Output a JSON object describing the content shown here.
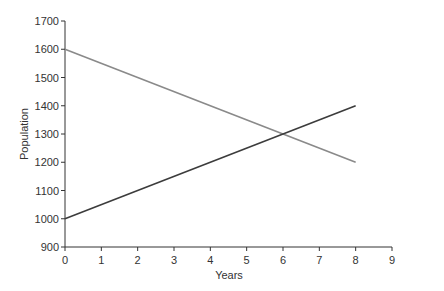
{
  "chart_data": {
    "type": "line",
    "title": "",
    "xlabel": "Years",
    "ylabel": "Population",
    "xlim": [
      0,
      9
    ],
    "ylim": [
      900,
      1700
    ],
    "xticks": [
      0,
      1,
      2,
      3,
      4,
      5,
      6,
      7,
      8,
      9
    ],
    "yticks": [
      900,
      1000,
      1100,
      1200,
      1300,
      1400,
      1500,
      1600,
      1700
    ],
    "grid": false,
    "legend": null,
    "series": [
      {
        "name": "Decreasing population",
        "color": "#8a8a8a",
        "x": [
          0,
          8
        ],
        "y": [
          1600,
          1200
        ]
      },
      {
        "name": "Increasing population",
        "color": "#3c3c3c",
        "x": [
          0,
          8
        ],
        "y": [
          1000,
          1400
        ]
      }
    ],
    "annotations": [
      {
        "type": "intersection",
        "x": 6,
        "y": 1300
      }
    ]
  },
  "axes": {
    "x_title": "Years",
    "y_title": "Population"
  }
}
